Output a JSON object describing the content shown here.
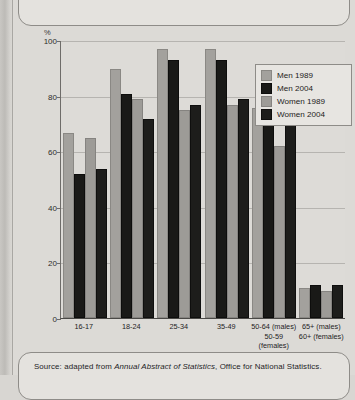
{
  "figure": {
    "title": "Economic activity rates, by sex, gender and age, 1989 and 2004",
    "percent_label": "%",
    "source_prefix": "Source:  adapted from ",
    "source_italic": "Annual Abstract of Statistics",
    "source_suffix": ", Office for National Statistics."
  },
  "chart_data": {
    "type": "bar",
    "title": "Economic activity rates, by sex, gender and age, 1989 and 2004",
    "xlabel": "Age groups",
    "ylabel": "%",
    "ylim": [
      0,
      100
    ],
    "yticks": [
      0,
      20,
      40,
      60,
      80,
      100
    ],
    "grid": true,
    "legend_position": "top-right",
    "categories": [
      "16-17",
      "18-24",
      "25-34",
      "35-49",
      "50-64 (males) 50-59 (females)",
      "65+ (males) 60+ (females)"
    ],
    "category_lines": [
      [
        "16-17",
        "",
        ""
      ],
      [
        "18-24",
        "",
        ""
      ],
      [
        "25-34",
        "",
        ""
      ],
      [
        "35-49",
        "",
        ""
      ],
      [
        "50-64 (males)",
        "50-59",
        "(females)"
      ],
      [
        "65+ (males)",
        "60+ (females)",
        ""
      ]
    ],
    "series": [
      {
        "name": "Men 1989",
        "color": "#a3a19d",
        "values": [
          66,
          89,
          96,
          96,
          75,
          10
        ]
      },
      {
        "name": "Men 2004",
        "color": "#191917",
        "values": [
          51,
          80,
          92,
          92,
          74,
          11
        ]
      },
      {
        "name": "Women 1989",
        "color": "#9d9b97",
        "values": [
          64,
          78,
          74,
          76,
          61,
          9
        ]
      },
      {
        "name": "Women 2004",
        "color": "#1d1d1b",
        "values": [
          53,
          71,
          76,
          78,
          69,
          11
        ]
      }
    ]
  }
}
